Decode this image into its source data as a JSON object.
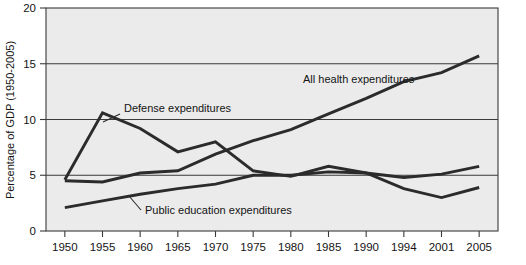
{
  "chart_data": {
    "type": "line",
    "title": "",
    "xlabel": "",
    "ylabel": "Percentage of GDP (1950-2005)",
    "categories": [
      "1950",
      "1955",
      "1960",
      "1965",
      "1970",
      "1975",
      "1980",
      "1985",
      "1990",
      "1994",
      "2001",
      "2005"
    ],
    "x": [
      1950,
      1955,
      1960,
      1965,
      1970,
      1975,
      1980,
      1985,
      1990,
      1994,
      2001,
      2005
    ],
    "ylim": [
      0,
      20
    ],
    "yticks": [
      "0",
      "5",
      "10",
      "15",
      "20"
    ],
    "ytick_values": [
      0,
      5,
      10,
      15,
      20
    ],
    "grid": true,
    "legend_position": "inline-annotations",
    "series": [
      {
        "name": "Defense expenditures",
        "values": [
          4.6,
          10.6,
          9.2,
          7.1,
          8.0,
          5.4,
          4.9,
          5.8,
          5.2,
          3.8,
          3.0,
          3.9
        ],
        "label": "Defense expenditures",
        "label_x": 124,
        "label_y": 112,
        "leader_from_x": 120,
        "leader_from_y": 114,
        "leader_to_x": 103,
        "leader_to_y": 122
      },
      {
        "name": "All health expenditures",
        "values": [
          4.5,
          4.4,
          5.2,
          5.4,
          6.9,
          8.1,
          9.1,
          10.5,
          11.9,
          13.4,
          14.2,
          15.7
        ],
        "label": "All health expenditures",
        "label_x": 303,
        "label_y": 83,
        "leader_from_x": 412,
        "leader_from_y": 79,
        "leader_to_x": 432,
        "leader_to_y": 75
      },
      {
        "name": "Public education expenditures",
        "values": [
          2.1,
          2.7,
          3.3,
          3.8,
          4.2,
          5.0,
          5.0,
          5.3,
          5.2,
          4.8,
          5.1,
          5.8
        ],
        "label": "Public education expenditures",
        "label_x": 145,
        "label_y": 214,
        "leader_from_x": 141,
        "leader_from_y": 210,
        "leader_to_x": 129,
        "leader_to_y": 196
      }
    ],
    "colors": {
      "line": "#2b2b2b",
      "plot_background": "#ebebeb",
      "axis": "#3a3a3a",
      "text": "#141414"
    }
  }
}
